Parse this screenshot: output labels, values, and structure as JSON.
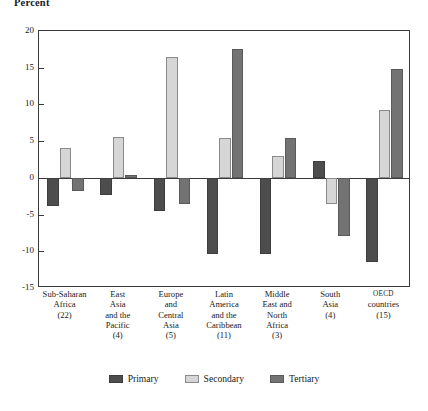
{
  "chart_data": {
    "type": "bar",
    "title": "",
    "ylabel": "Percent",
    "xlabel": "",
    "ylim": [
      -15,
      20
    ],
    "yticks": [
      20,
      15,
      10,
      5,
      0,
      -5,
      -10,
      -15
    ],
    "ytick_labels": [
      "20",
      "15",
      "10",
      "5",
      "0",
      "-5",
      "-10",
      "-15"
    ],
    "grid": false,
    "legend_position": "bottom",
    "categories": [
      "Sub-Saharan Africa (22)",
      "East Asia and the Pacific (4)",
      "Europe and Central Asia (5)",
      "Latin America and the Caribbean (11)",
      "Middle East and North Africa (3)",
      "South Asia (4)",
      "OECD countries (15)"
    ],
    "category_lines": [
      [
        "Sub-Saharan",
        "Africa",
        "(22)"
      ],
      [
        "East",
        "Asia",
        "and the",
        "Pacific",
        "(4)"
      ],
      [
        "Europe",
        "and",
        "Central",
        "Asia",
        "(5)"
      ],
      [
        "Latin",
        "America",
        "and the",
        "Caribbean",
        "(11)"
      ],
      [
        "Middle",
        "East and",
        "North",
        "Africa",
        "(3)"
      ],
      [
        "South",
        "Asia",
        "(4)"
      ],
      [
        "OECD",
        "countries",
        "(15)"
      ]
    ],
    "series": [
      {
        "name": "Primary",
        "color": "#4d4d4d",
        "values": [
          -3.8,
          -2.3,
          -4.5,
          -10.4,
          -10.4,
          2.3,
          -11.5
        ]
      },
      {
        "name": "Secondary",
        "color": "#d6d6d6",
        "values": [
          4.1,
          5.6,
          16.4,
          5.4,
          3.0,
          -3.5,
          9.3
        ]
      },
      {
        "name": "Tertiary",
        "color": "#737373",
        "values": [
          -1.8,
          0.4,
          -3.6,
          17.6,
          5.4,
          -7.9,
          14.8
        ]
      }
    ]
  },
  "legend": {
    "items": [
      {
        "label": "Primary"
      },
      {
        "label": "Secondary"
      },
      {
        "label": "Tertiary"
      }
    ]
  }
}
